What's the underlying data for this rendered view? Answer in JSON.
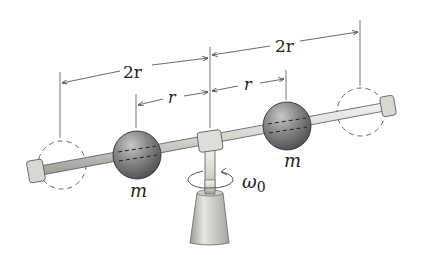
{
  "diagram": {
    "type": "rotating-rod-with-masses",
    "labels": {
      "outer_left_dim": "2r",
      "outer_right_dim": "2r",
      "inner_left_dim": "r",
      "inner_right_dim": "r",
      "mass_left": "m",
      "mass_right": "m",
      "angular_velocity": "ω",
      "angular_velocity_sub": "0"
    },
    "colors": {
      "sphere": "#7a7a7a",
      "rod": "#d9d9d4",
      "line": "#444444",
      "dashed": "#666666"
    }
  }
}
